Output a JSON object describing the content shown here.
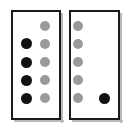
{
  "figure": {
    "canvas": {
      "width": 130,
      "height": 130,
      "background": "#ffffff"
    },
    "colors": {
      "filled": "#111111",
      "unfilled": "#9a9a9a",
      "panel_border": "#1a1a1a",
      "panel_fill": "#ffffff",
      "shadow": "#b9b9b9"
    }
  },
  "panels": [
    {
      "name": "left-panel",
      "label": "",
      "box": {
        "x": 11,
        "y": 10,
        "width": 50,
        "height": 110
      },
      "columns": [
        {
          "name": "left-panel-column-1",
          "cx": 26,
          "dots": [
            {
              "cy": 43,
              "r": 5.5,
              "state": "filled"
            },
            {
              "cy": 62,
              "r": 5.5,
              "state": "filled"
            },
            {
              "cy": 80,
              "r": 5.5,
              "state": "filled"
            },
            {
              "cy": 98,
              "r": 5.5,
              "state": "filled"
            }
          ]
        },
        {
          "name": "left-panel-column-2",
          "cx": 45,
          "dots": [
            {
              "cy": 26,
              "r": 5.0,
              "state": "unfilled"
            },
            {
              "cy": 44,
              "r": 5.0,
              "state": "unfilled"
            },
            {
              "cy": 62,
              "r": 5.0,
              "state": "unfilled"
            },
            {
              "cy": 80,
              "r": 5.0,
              "state": "unfilled"
            },
            {
              "cy": 98,
              "r": 5.0,
              "state": "unfilled"
            }
          ]
        }
      ]
    },
    {
      "name": "right-panel",
      "label": "",
      "box": {
        "x": 69,
        "y": 10,
        "width": 51,
        "height": 110
      },
      "columns": [
        {
          "name": "right-panel-column-1",
          "cx": 78,
          "dots": [
            {
              "cy": 26,
              "r": 5.0,
              "state": "unfilled"
            },
            {
              "cy": 44,
              "r": 5.0,
              "state": "unfilled"
            },
            {
              "cy": 62,
              "r": 5.0,
              "state": "unfilled"
            },
            {
              "cy": 80,
              "r": 5.0,
              "state": "unfilled"
            },
            {
              "cy": 98,
              "r": 5.0,
              "state": "unfilled"
            }
          ]
        },
        {
          "name": "right-panel-column-2",
          "cx": 104,
          "dots": [
            {
              "cy": 98,
              "r": 5.5,
              "state": "filled"
            }
          ]
        }
      ]
    }
  ]
}
